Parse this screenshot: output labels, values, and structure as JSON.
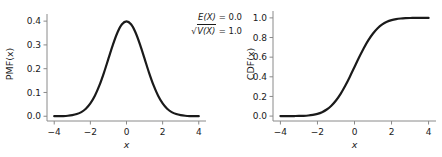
{
  "figure": {
    "background": "#ffffff",
    "line_color": "#1a1a1a",
    "axis_color": "#8a8a8a",
    "text_color": "#1a1a1a"
  },
  "annotation": {
    "expectation_symbol": "E(X)",
    "expectation_eq": " = ",
    "expectation_value": "0.0",
    "sqrt_glyph": "√",
    "variance_symbol": "V(X)",
    "variance_eq": " = ",
    "variance_value": "1.0",
    "line1": "E(X) = 0.0",
    "line2": "√V(X) = 1.0"
  },
  "chart_data": [
    {
      "type": "line",
      "id": "pmf-plot",
      "title": "",
      "xlabel": "x",
      "ylabel": "PMF(x)",
      "xlim": [
        -4.4,
        4.4
      ],
      "ylim": [
        -0.02,
        0.43
      ],
      "xticks": [
        -4,
        -2,
        0,
        2,
        4
      ],
      "xticklabels": [
        "−4",
        "−2",
        "0",
        "2",
        "4"
      ],
      "yticks": [
        0.0,
        0.1,
        0.2,
        0.3,
        0.4
      ],
      "yticklabels": [
        "0.0",
        "0.1",
        "0.2",
        "0.3",
        "0.4"
      ],
      "grid": false,
      "legend": null,
      "series": [
        {
          "name": "standard normal PDF",
          "color": "#1a1a1a",
          "linewidth": 2.2,
          "x": [
            -4.0,
            -3.75,
            -3.5,
            -3.25,
            -3.0,
            -2.75,
            -2.5,
            -2.25,
            -2.0,
            -1.75,
            -1.5,
            -1.25,
            -1.0,
            -0.75,
            -0.5,
            -0.25,
            0.0,
            0.25,
            0.5,
            0.75,
            1.0,
            1.25,
            1.5,
            1.75,
            2.0,
            2.25,
            2.5,
            2.75,
            3.0,
            3.25,
            3.5,
            3.75,
            4.0
          ],
          "y": [
            0.0001,
            0.0004,
            0.0009,
            0.002,
            0.0044,
            0.0091,
            0.0175,
            0.0317,
            0.054,
            0.0863,
            0.1295,
            0.1826,
            0.242,
            0.3011,
            0.3521,
            0.3867,
            0.3989,
            0.3867,
            0.3521,
            0.3011,
            0.242,
            0.1826,
            0.1295,
            0.0863,
            0.054,
            0.0317,
            0.0175,
            0.0091,
            0.0044,
            0.002,
            0.0009,
            0.0004,
            0.0001
          ]
        }
      ]
    },
    {
      "type": "line",
      "id": "cdf-plot",
      "title": "",
      "xlabel": "x",
      "ylabel": "CDF(x)",
      "xlim": [
        -4.4,
        4.4
      ],
      "ylim": [
        -0.05,
        1.07
      ],
      "xticks": [
        -4,
        -2,
        0,
        2,
        4
      ],
      "xticklabels": [
        "−4",
        "−2",
        "0",
        "2",
        "4"
      ],
      "yticks": [
        0.0,
        0.2,
        0.4,
        0.6,
        0.8,
        1.0
      ],
      "yticklabels": [
        "0.0",
        "0.2",
        "0.4",
        "0.6",
        "0.8",
        "1.0"
      ],
      "grid": false,
      "legend": null,
      "series": [
        {
          "name": "standard normal CDF",
          "color": "#1a1a1a",
          "linewidth": 2.2,
          "x": [
            -4.0,
            -3.75,
            -3.5,
            -3.25,
            -3.0,
            -2.75,
            -2.5,
            -2.25,
            -2.0,
            -1.75,
            -1.5,
            -1.25,
            -1.0,
            -0.75,
            -0.5,
            -0.25,
            0.0,
            0.25,
            0.5,
            0.75,
            1.0,
            1.25,
            1.5,
            1.75,
            2.0,
            2.25,
            2.5,
            2.75,
            3.0,
            3.25,
            3.5,
            3.75,
            4.0
          ],
          "y": [
            3e-05,
            9e-05,
            0.00023,
            0.00058,
            0.00135,
            0.00298,
            0.00621,
            0.01222,
            0.02275,
            0.04006,
            0.06681,
            0.10565,
            0.15866,
            0.22663,
            0.30854,
            0.40129,
            0.5,
            0.59871,
            0.69146,
            0.77337,
            0.84134,
            0.89435,
            0.93319,
            0.95994,
            0.97725,
            0.98778,
            0.99379,
            0.99702,
            0.99865,
            0.99942,
            0.99977,
            0.99991,
            0.99997
          ]
        }
      ]
    }
  ]
}
